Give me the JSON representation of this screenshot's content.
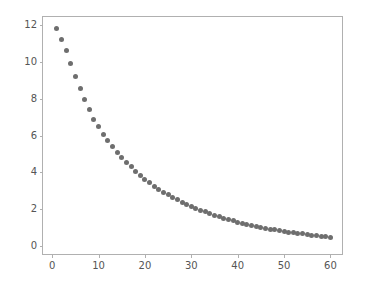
{
  "chart_data": {
    "type": "scatter",
    "title": "",
    "xlabel": "",
    "ylabel": "",
    "grid": false,
    "legend": false,
    "marker": {
      "shape": "circle",
      "color": "#6e6e6e",
      "size_px": 5
    },
    "xlim": [
      -2.0,
      62.5
    ],
    "ylim": [
      -0.45,
      12.45
    ],
    "xticks": [
      0,
      10,
      20,
      30,
      40,
      50,
      60
    ],
    "xtick_labels": [
      "0",
      "10",
      "20",
      "30",
      "40",
      "50",
      "60"
    ],
    "yticks": [
      0,
      2,
      4,
      6,
      8,
      10,
      12
    ],
    "ytick_labels": [
      "0",
      "2",
      "4",
      "6",
      "8",
      "10",
      "12"
    ],
    "x": [
      1,
      2,
      3,
      4,
      5,
      6,
      7,
      8,
      9,
      10,
      11,
      12,
      13,
      14,
      15,
      16,
      17,
      18,
      19,
      20,
      21,
      22,
      23,
      24,
      25,
      26,
      27,
      28,
      29,
      30,
      31,
      32,
      33,
      34,
      35,
      36,
      37,
      38,
      39,
      40,
      41,
      42,
      43,
      44,
      45,
      46,
      47,
      48,
      49,
      50,
      51,
      52,
      53,
      54,
      55,
      56,
      57,
      58,
      59,
      60
    ],
    "values": [
      11.8,
      11.25,
      10.6,
      9.9,
      9.2,
      8.55,
      7.98,
      7.4,
      6.85,
      6.47,
      6.08,
      5.75,
      5.4,
      5.1,
      4.8,
      4.55,
      4.3,
      4.05,
      3.85,
      3.6,
      3.42,
      3.25,
      3.08,
      2.92,
      2.78,
      2.62,
      2.5,
      2.38,
      2.25,
      2.15,
      2.04,
      1.94,
      1.84,
      1.75,
      1.66,
      1.58,
      1.5,
      1.42,
      1.35,
      1.28,
      1.22,
      1.15,
      1.1,
      1.05,
      1.0,
      0.95,
      0.9,
      0.86,
      0.82,
      0.78,
      0.74,
      0.7,
      0.67,
      0.64,
      0.61,
      0.58,
      0.55,
      0.52,
      0.5,
      0.45
    ]
  }
}
